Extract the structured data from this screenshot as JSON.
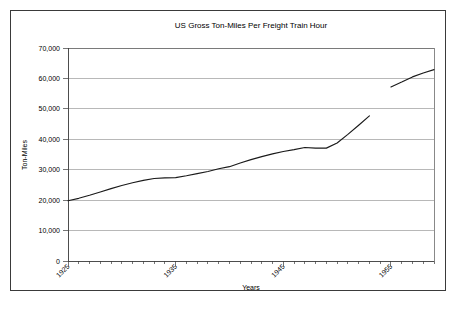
{
  "figure": {
    "background_color": "#ffffff",
    "border_color": "#3a3a3a",
    "axis_color": "#3a3a3a",
    "grid_color": "#9a9a9a",
    "line_color": "#1a1a1a"
  },
  "chart_data": {
    "type": "line",
    "title": "US Gross Ton-Miles Per Freight Train Hour",
    "xlabel": "Years",
    "ylabel": "Ton-Miles",
    "xlim": [
      1925,
      1959
    ],
    "ylim": [
      0,
      70000
    ],
    "grid": true,
    "legend": null,
    "y_ticks": [
      0,
      10000,
      20000,
      30000,
      40000,
      50000,
      60000,
      70000
    ],
    "y_tick_labels": [
      "0",
      "10,000",
      "20,000",
      "30,000",
      "40,000",
      "50,000",
      "60,000",
      "70,000"
    ],
    "x_ticks": [
      1925,
      1926,
      1927,
      1928,
      1929,
      1930,
      1931,
      1932,
      1933,
      1934,
      1935,
      1936,
      1937,
      1938,
      1939,
      1940,
      1941,
      1942,
      1943,
      1944,
      1945,
      1946,
      1947,
      1948,
      1949,
      1950,
      1951,
      1952,
      1953,
      1954,
      1955,
      1956,
      1957,
      1958,
      1959
    ],
    "x_tick_labels": [
      "1925",
      "1935",
      "1945",
      "1955"
    ],
    "x_labeled_ticks": [
      1925,
      1935,
      1945,
      1955
    ],
    "x_tick_label_rotation": -45,
    "series": [
      {
        "name": "US Gross Ton-Miles Per Freight Train Hour",
        "x": [
          1925,
          1926,
          1927,
          1928,
          1929,
          1930,
          1931,
          1932,
          1933,
          1934,
          1935,
          1936,
          1937,
          1938,
          1939,
          1940,
          1941,
          1942,
          1943,
          1944,
          1945,
          1946,
          1947,
          1948,
          1949,
          1950,
          1951,
          1952,
          1953
        ],
        "values": [
          19800,
          20600,
          21600,
          22700,
          23800,
          24800,
          25700,
          26500,
          27100,
          27300,
          27400,
          28000,
          28700,
          29400,
          30300,
          31000,
          32200,
          33300,
          34300,
          35200,
          36000,
          36600,
          37300,
          37100,
          37100,
          38800,
          41600,
          44600,
          47700
        ]
      },
      {
        "name": "US Gross Ton-Miles Per Freight Train Hour (continued)",
        "x": [
          1953,
          1954,
          1955,
          1956,
          1957,
          1958,
          1959
        ],
        "values": [
          51900,
          null,
          57200,
          58800,
          60500,
          61800,
          62900
        ]
      }
    ]
  }
}
